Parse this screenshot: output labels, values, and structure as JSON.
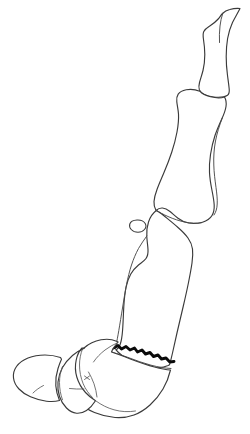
{
  "figure": {
    "background_color": "#ffffff",
    "outline_color": "#3a3a3a",
    "fracture_color": "#0a0a0a",
    "detail_color": "#5a5a5a",
    "canvas": {
      "width": 250,
      "height": 434
    }
  },
  "parts": [
    {
      "name": "distal-phalanx",
      "label": "Distal phalanx",
      "position": "top",
      "note": "Tapered claw-like element with pointed apex at upper right"
    },
    {
      "name": "middle-phalanx",
      "label": "Middle phalanx",
      "position": "upper-middle",
      "note": "Elongated shaft with expanded proximal and distal ends"
    },
    {
      "name": "proximal-phalanx",
      "label": "Proximal phalanx",
      "position": "lower-middle",
      "note": "Long shaft running diagonally to lower left"
    },
    {
      "name": "sesamoid-bone",
      "label": "Sesamoid bone",
      "position": "left of proximal joint",
      "note": "Small isolated oval element"
    },
    {
      "name": "proximal-articulation-block",
      "label": "Proximal articular block",
      "position": "bottom-left",
      "note": "Broad rounded mass of two overlapping bone bodies"
    },
    {
      "name": "fracture-line",
      "label": "Fracture line",
      "position": "across distal proximal phalanx",
      "note": "Heavy jagged zigzag stroke"
    }
  ]
}
